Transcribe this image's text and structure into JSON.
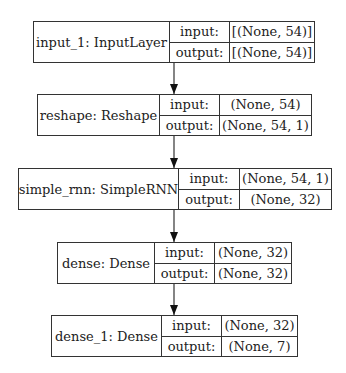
{
  "diagram": {
    "type": "keras-model-plot",
    "nodes": [
      {
        "name": "input_1: InputLayer",
        "input_label": "input:",
        "output_label": "output:",
        "input": "[(None, 54)]",
        "output": "[(None, 54)]"
      },
      {
        "name": "reshape: Reshape",
        "input_label": "input:",
        "output_label": "output:",
        "input": "(None, 54)",
        "output": "(None, 54, 1)"
      },
      {
        "name": "simple_rnn: SimpleRNN",
        "input_label": "input:",
        "output_label": "output:",
        "input": "(None, 54, 1)",
        "output": "(None, 32)"
      },
      {
        "name": "dense: Dense",
        "input_label": "input:",
        "output_label": "output:",
        "input": "(None, 32)",
        "output": "(None, 32)"
      },
      {
        "name": "dense_1: Dense",
        "input_label": "input:",
        "output_label": "output:",
        "input": "(None, 32)",
        "output": "(None, 7)"
      }
    ],
    "edges": [
      {
        "from": "input_1",
        "to": "reshape"
      },
      {
        "from": "reshape",
        "to": "simple_rnn"
      },
      {
        "from": "simple_rnn",
        "to": "dense"
      },
      {
        "from": "dense",
        "to": "dense_1"
      }
    ],
    "colors": {
      "line": "#333333",
      "background": "#ffffff"
    }
  }
}
